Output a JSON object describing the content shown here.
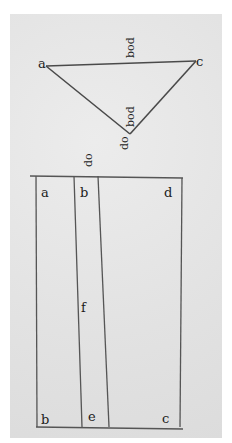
{
  "diagram": {
    "kind": "manuscript geometric figure",
    "paper_color": "#e4e4e4",
    "ink_color": "#3a3a3a",
    "triangle": {
      "vertices": {
        "left": "a",
        "right": "c",
        "bottom": "d"
      },
      "top_edge_annotation": "bod",
      "inner_annotation": "bod",
      "bottom_vertex_annotation": "do"
    },
    "above_rectangle_annotation": "do",
    "rectangle": {
      "top_labels": [
        "a",
        "b",
        "d"
      ],
      "middle_label": "f",
      "bottom_labels": [
        "b",
        "e",
        "c"
      ]
    }
  }
}
